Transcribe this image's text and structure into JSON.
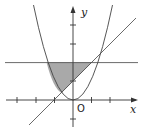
{
  "diagram": {
    "type": "function-graph",
    "labels": {
      "x_axis": "x",
      "y_axis": "y",
      "origin": "O"
    },
    "curves": [
      {
        "name": "parabola",
        "equation": "y = x^2"
      },
      {
        "name": "line",
        "equation": "y = x + 1"
      },
      {
        "name": "horizontal-line",
        "equation": "y = 2"
      }
    ],
    "shaded_region": "bounded by y=2, y=x^2 and y=x+1",
    "colors": {
      "axis": "#333333",
      "curve": "#444444",
      "shade": "#a9a9a9"
    }
  }
}
